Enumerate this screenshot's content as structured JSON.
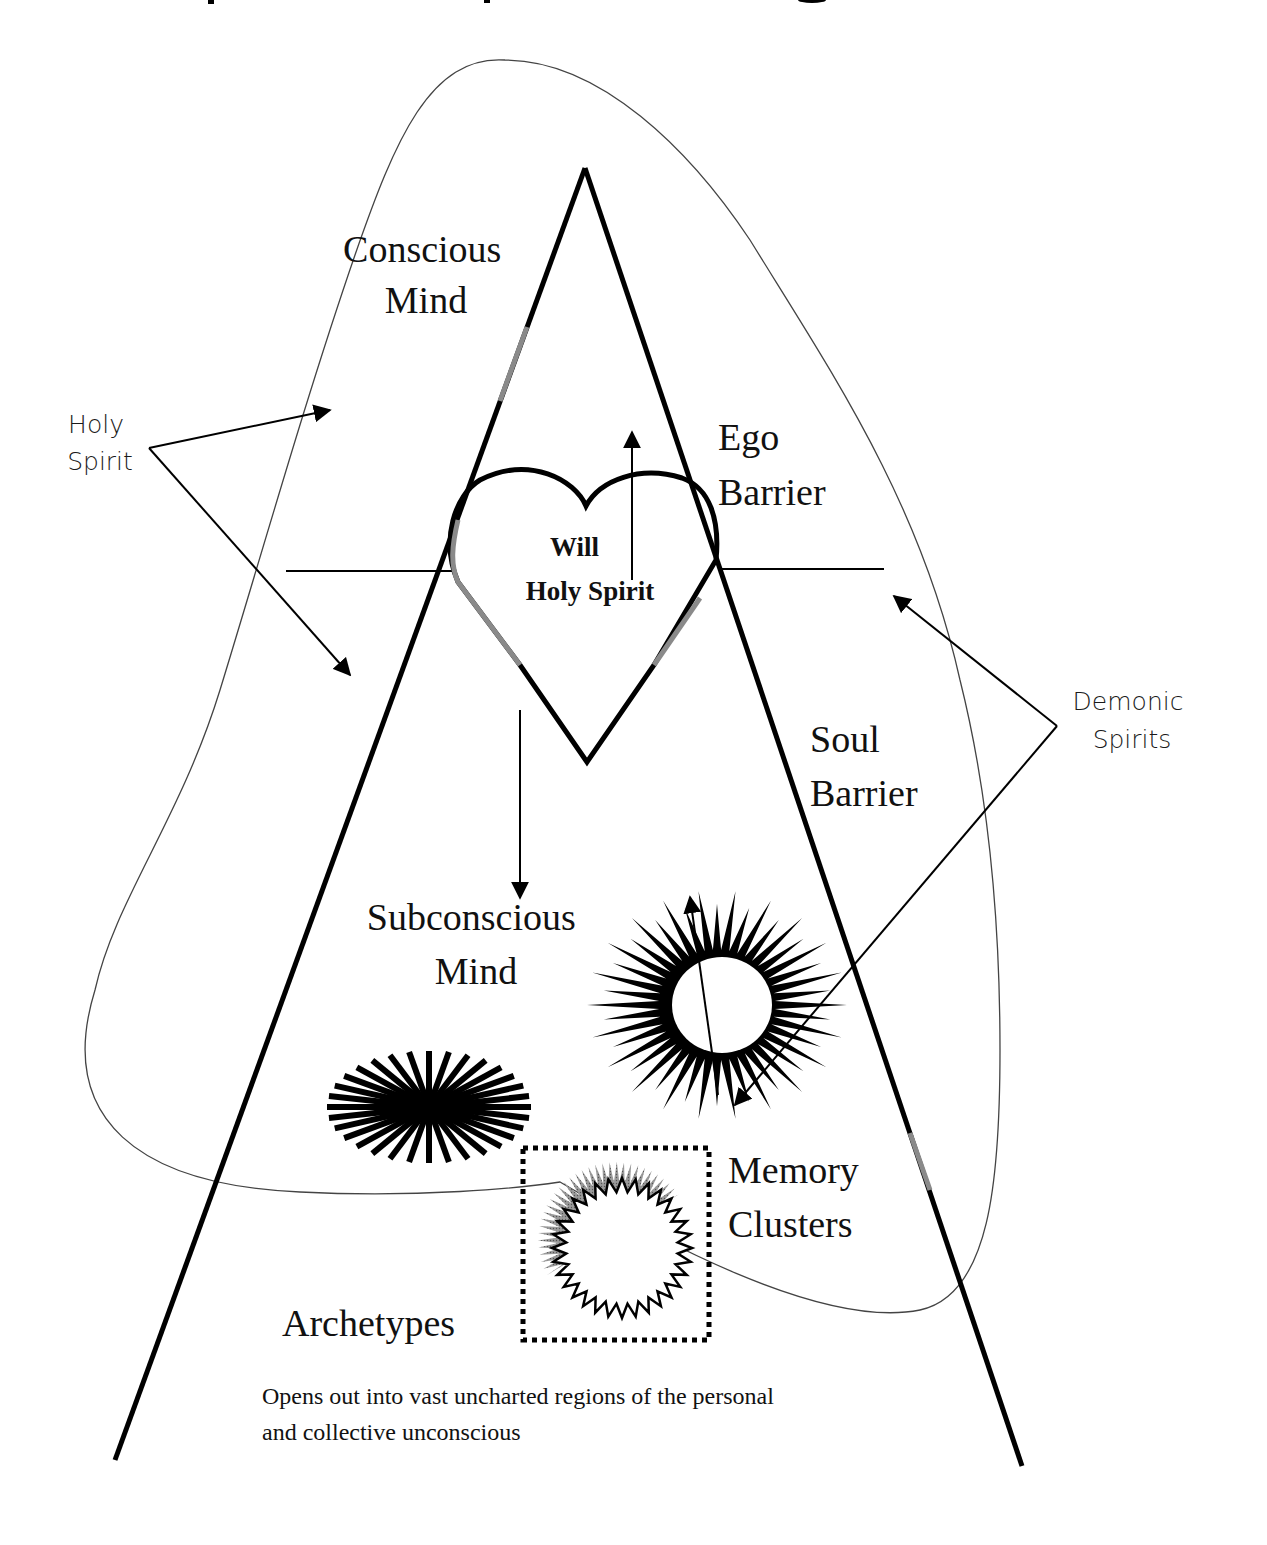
{
  "diagram": {
    "title_fragment_visible": true,
    "labels": {
      "conscious_mind": [
        "Conscious",
        "Mind"
      ],
      "holy_spirit_left": [
        "Holy",
        "Spirit"
      ],
      "ego_barrier": [
        "Ego",
        "Barrier"
      ],
      "heart": [
        "Will",
        "Holy Spirit"
      ],
      "demonic_spirits": [
        "Demonic",
        "Spirits"
      ],
      "soul_barrier": [
        "Soul",
        "Barrier"
      ],
      "subconscious_mind": [
        "Subconscious",
        "Mind"
      ],
      "memory_clusters": [
        "Memory",
        "Clusters"
      ],
      "archetypes": "Archetypes",
      "caption": [
        "Opens out into vast uncharted regions of the personal",
        "and collective unconscious"
      ]
    },
    "colors": {
      "ink": "#000000",
      "thin_outline": "#444444",
      "faded_segment": "#8a8a8a",
      "background": "#ffffff"
    }
  }
}
